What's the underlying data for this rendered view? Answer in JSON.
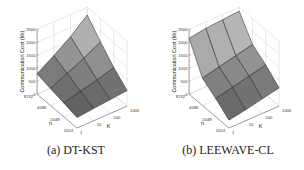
{
  "chart_data": [
    {
      "type": "surface3d",
      "title": "",
      "caption": "(a) DT-KST",
      "xlabel": "n",
      "ylabel": "K",
      "zlabel": "Communication Cost (kb)",
      "x_ticks": [
        "1024",
        "2048",
        "4096",
        "8192"
      ],
      "y_ticks": [
        "1",
        "10",
        "100",
        "1000"
      ],
      "z_ticks": [
        "0",
        "500",
        "1000",
        "1500",
        "2000",
        "2500"
      ],
      "zlim": [
        0,
        2500
      ],
      "grid": true,
      "x": [
        1024,
        2048,
        4096,
        8192
      ],
      "y": [
        1,
        10,
        100,
        1000
      ],
      "z": [
        [
          400,
          470,
          530,
          600
        ],
        [
          530,
          700,
          850,
          1050
        ],
        [
          650,
          950,
          1250,
          1600
        ],
        [
          780,
          1200,
          1650,
          2200
        ]
      ]
    },
    {
      "type": "surface3d",
      "title": "",
      "caption": "(b) LEEWAVE-CL",
      "xlabel": "n",
      "ylabel": "K",
      "zlabel": "Communication Cost (kb)",
      "x_ticks": [
        "1024",
        "2048",
        "4096",
        "8192"
      ],
      "y_ticks": [
        "1",
        "10",
        "100",
        "1000"
      ],
      "z_ticks": [
        "0",
        "500",
        "1000",
        "1500",
        "2000",
        "2500"
      ],
      "zlim": [
        0,
        2500
      ],
      "grid": true,
      "x": [
        1024,
        2048,
        4096,
        8192
      ],
      "y": [
        1,
        10,
        100,
        1000
      ],
      "z": [
        [
          300,
          420,
          560,
          700
        ],
        [
          700,
          850,
          1000,
          1150
        ],
        [
          1050,
          1200,
          1350,
          1500
        ],
        [
          2150,
          2250,
          2300,
          2350
        ]
      ]
    }
  ],
  "captions": {
    "a": "(a) DT-KST",
    "b": "(b) LEEWAVE-CL"
  }
}
